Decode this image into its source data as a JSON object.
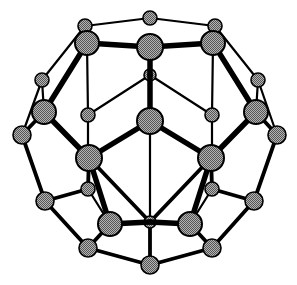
{
  "figure": {
    "kind": "molecular-structure-diagram",
    "background_color": "#ffffff",
    "atom_fill_color": "#8c8c8c",
    "atom_outline_color": "#000000",
    "bond_color": "#000000",
    "width": 297,
    "height": 285
  },
  "legend": {
    "front_atom_label": "front atom",
    "back_atom_label": "back atom",
    "bond_label": "bond"
  },
  "chart_data": {
    "type": "scatter",
    "xlabel": "",
    "ylabel": "",
    "xlim": [
      0,
      297
    ],
    "ylim": [
      0,
      285
    ],
    "grid": false,
    "legend": "none",
    "atom_radius_front": 11,
    "atom_radius_mid": 8,
    "atom_radius_back": 6,
    "bond_width_front": 5.5,
    "bond_width_mid": 3.8,
    "bond_width_back": 2.2,
    "atoms": [
      {
        "id": 0,
        "x": 150,
        "y": 18,
        "r": 7,
        "depth": "back"
      },
      {
        "id": 1,
        "x": 85,
        "y": 26,
        "r": 7,
        "depth": "back"
      },
      {
        "id": 2,
        "x": 215,
        "y": 26,
        "r": 7,
        "depth": "back"
      },
      {
        "id": 3,
        "x": 87,
        "y": 43,
        "r": 12,
        "depth": "front"
      },
      {
        "id": 4,
        "x": 150,
        "y": 47,
        "r": 13,
        "depth": "front"
      },
      {
        "id": 5,
        "x": 213,
        "y": 43,
        "r": 12,
        "depth": "front"
      },
      {
        "id": 6,
        "x": 42,
        "y": 80,
        "r": 7,
        "depth": "back"
      },
      {
        "id": 7,
        "x": 258,
        "y": 80,
        "r": 7,
        "depth": "back"
      },
      {
        "id": 8,
        "x": 150,
        "y": 75,
        "r": 6,
        "depth": "back"
      },
      {
        "id": 9,
        "x": 44,
        "y": 112,
        "r": 12,
        "depth": "front"
      },
      {
        "id": 10,
        "x": 256,
        "y": 112,
        "r": 12,
        "depth": "front"
      },
      {
        "id": 11,
        "x": 88,
        "y": 115,
        "r": 7,
        "depth": "back"
      },
      {
        "id": 12,
        "x": 212,
        "y": 115,
        "r": 7,
        "depth": "back"
      },
      {
        "id": 13,
        "x": 150,
        "y": 121,
        "r": 13,
        "depth": "front"
      },
      {
        "id": 14,
        "x": 22,
        "y": 135,
        "r": 9,
        "depth": "mid"
      },
      {
        "id": 15,
        "x": 277,
        "y": 135,
        "r": 9,
        "depth": "mid"
      },
      {
        "id": 16,
        "x": 89,
        "y": 158,
        "r": 13,
        "depth": "front"
      },
      {
        "id": 17,
        "x": 211,
        "y": 158,
        "r": 13,
        "depth": "front"
      },
      {
        "id": 18,
        "x": 88,
        "y": 189,
        "r": 7,
        "depth": "back"
      },
      {
        "id": 19,
        "x": 212,
        "y": 189,
        "r": 7,
        "depth": "back"
      },
      {
        "id": 20,
        "x": 45,
        "y": 201,
        "r": 9,
        "depth": "mid"
      },
      {
        "id": 21,
        "x": 254,
        "y": 201,
        "r": 9,
        "depth": "mid"
      },
      {
        "id": 22,
        "x": 110,
        "y": 224,
        "r": 12,
        "depth": "front"
      },
      {
        "id": 23,
        "x": 190,
        "y": 224,
        "r": 12,
        "depth": "front"
      },
      {
        "id": 24,
        "x": 150,
        "y": 222,
        "r": 6,
        "depth": "back"
      },
      {
        "id": 25,
        "x": 88,
        "y": 248,
        "r": 9,
        "depth": "mid"
      },
      {
        "id": 26,
        "x": 212,
        "y": 248,
        "r": 9,
        "depth": "mid"
      },
      {
        "id": 27,
        "x": 150,
        "y": 265,
        "r": 9,
        "depth": "mid"
      }
    ],
    "bonds": [
      {
        "a": 0,
        "b": 1,
        "depth": "back"
      },
      {
        "a": 0,
        "b": 2,
        "depth": "back"
      },
      {
        "a": 1,
        "b": 3,
        "depth": "back"
      },
      {
        "a": 2,
        "b": 5,
        "depth": "back"
      },
      {
        "a": 3,
        "b": 4,
        "depth": "front"
      },
      {
        "a": 4,
        "b": 5,
        "depth": "front"
      },
      {
        "a": 1,
        "b": 6,
        "depth": "back"
      },
      {
        "a": 2,
        "b": 7,
        "depth": "back"
      },
      {
        "a": 3,
        "b": 9,
        "depth": "front"
      },
      {
        "a": 5,
        "b": 10,
        "depth": "front"
      },
      {
        "a": 4,
        "b": 8,
        "depth": "front"
      },
      {
        "a": 8,
        "b": 11,
        "depth": "back"
      },
      {
        "a": 8,
        "b": 12,
        "depth": "back"
      },
      {
        "a": 8,
        "b": 13,
        "depth": "front"
      },
      {
        "a": 3,
        "b": 11,
        "depth": "back"
      },
      {
        "a": 5,
        "b": 12,
        "depth": "back"
      },
      {
        "a": 6,
        "b": 9,
        "depth": "back"
      },
      {
        "a": 7,
        "b": 10,
        "depth": "back"
      },
      {
        "a": 6,
        "b": 14,
        "depth": "back"
      },
      {
        "a": 7,
        "b": 15,
        "depth": "back"
      },
      {
        "a": 9,
        "b": 14,
        "depth": "mid"
      },
      {
        "a": 10,
        "b": 15,
        "depth": "mid"
      },
      {
        "a": 9,
        "b": 16,
        "depth": "front"
      },
      {
        "a": 10,
        "b": 17,
        "depth": "front"
      },
      {
        "a": 11,
        "b": 18,
        "depth": "back"
      },
      {
        "a": 12,
        "b": 19,
        "depth": "back"
      },
      {
        "a": 13,
        "b": 16,
        "depth": "front"
      },
      {
        "a": 13,
        "b": 17,
        "depth": "front"
      },
      {
        "a": 14,
        "b": 20,
        "depth": "mid"
      },
      {
        "a": 15,
        "b": 21,
        "depth": "mid"
      },
      {
        "a": 16,
        "b": 18,
        "depth": "mid"
      },
      {
        "a": 17,
        "b": 19,
        "depth": "mid"
      },
      {
        "a": 16,
        "b": 22,
        "depth": "front"
      },
      {
        "a": 17,
        "b": 23,
        "depth": "front"
      },
      {
        "a": 18,
        "b": 22,
        "depth": "back"
      },
      {
        "a": 19,
        "b": 23,
        "depth": "back"
      },
      {
        "a": 20,
        "b": 18,
        "depth": "mid"
      },
      {
        "a": 21,
        "b": 19,
        "depth": "mid"
      },
      {
        "a": 20,
        "b": 25,
        "depth": "mid"
      },
      {
        "a": 21,
        "b": 26,
        "depth": "mid"
      },
      {
        "a": 22,
        "b": 24,
        "depth": "front"
      },
      {
        "a": 23,
        "b": 24,
        "depth": "front"
      },
      {
        "a": 24,
        "b": 13,
        "depth": "back"
      },
      {
        "a": 24,
        "b": 16,
        "depth": "mid"
      },
      {
        "a": 24,
        "b": 17,
        "depth": "mid"
      },
      {
        "a": 24,
        "b": 27,
        "depth": "mid"
      },
      {
        "a": 22,
        "b": 25,
        "depth": "mid"
      },
      {
        "a": 23,
        "b": 26,
        "depth": "mid"
      },
      {
        "a": 25,
        "b": 27,
        "depth": "mid"
      },
      {
        "a": 26,
        "b": 27,
        "depth": "mid"
      }
    ]
  }
}
